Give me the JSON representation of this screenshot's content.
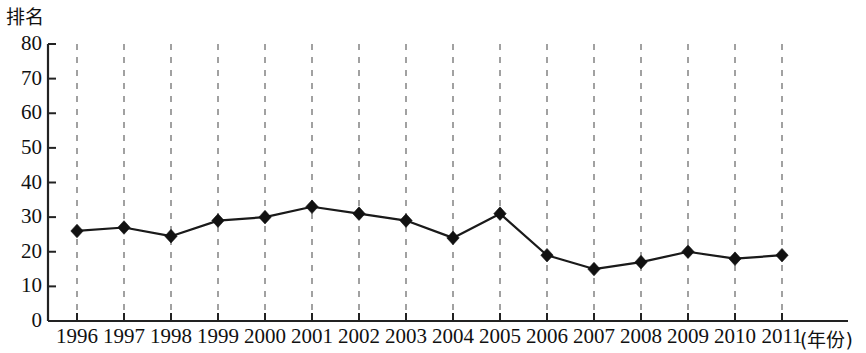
{
  "chart_data": {
    "type": "line",
    "title": "",
    "subtitle": "",
    "ylabel": "排名",
    "xlabel": "(年份)",
    "categories": [
      "1996",
      "1997",
      "1998",
      "1999",
      "2000",
      "2001",
      "2002",
      "2003",
      "2004",
      "2005",
      "2006",
      "2007",
      "2008",
      "2009",
      "2010",
      "2011"
    ],
    "values": [
      26,
      27,
      24.5,
      29,
      30,
      33,
      31,
      29,
      24,
      31,
      19,
      15,
      17,
      20,
      18,
      19
    ],
    "series": [
      {
        "name": "排名",
        "values": [
          26,
          27,
          24.5,
          29,
          30,
          33,
          31,
          29,
          24,
          31,
          19,
          15,
          17,
          20,
          18,
          19
        ]
      }
    ],
    "ylim": [
      0,
      80
    ],
    "y_ticks": [
      0,
      10,
      20,
      30,
      40,
      50,
      60,
      70,
      80
    ],
    "y_tick_labels": [
      "0",
      "10",
      "20",
      "30",
      "40",
      "50",
      "60",
      "70",
      "80"
    ],
    "x_tick_labels": [
      "1996",
      "1997",
      "1998",
      "1999",
      "2000",
      "2001",
      "2002",
      "2003",
      "2004",
      "2005",
      "2006",
      "2007",
      "2008",
      "2009",
      "2010",
      "2011"
    ],
    "grid": "vertical-dashed",
    "legend": "none",
    "marker": "diamond",
    "line_color": "#1a1a1a",
    "marker_color": "#111111",
    "grid_color": "#8a8a8a",
    "axis_color": "#222222",
    "background": "#ffffff"
  }
}
